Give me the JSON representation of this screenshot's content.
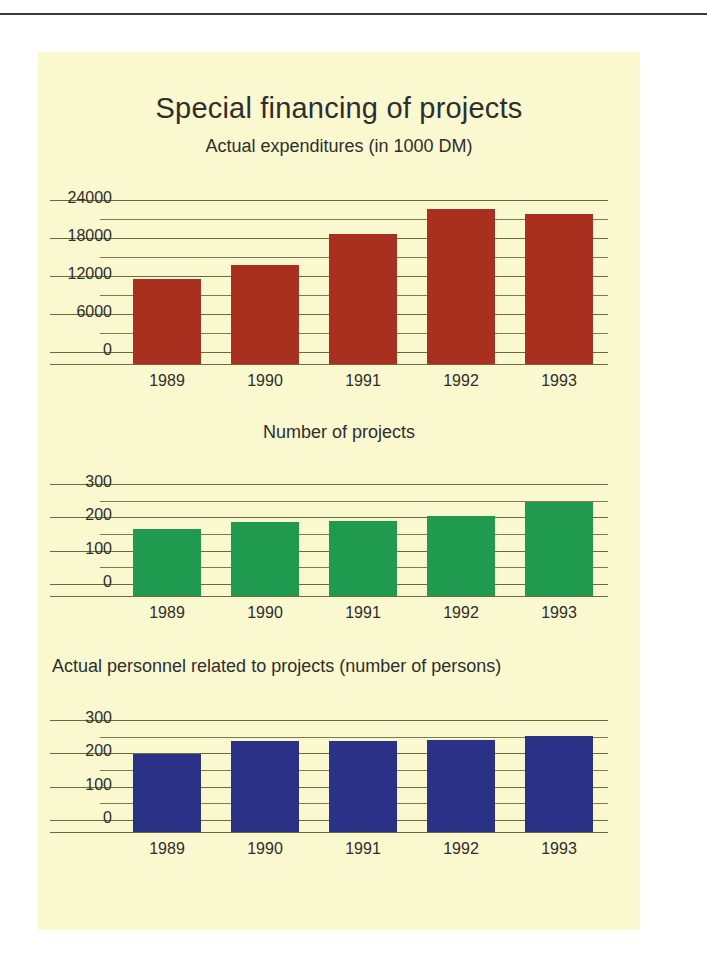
{
  "page": {
    "background_color": "#faf8ce",
    "page_color": "#ffffff",
    "rule_color": "#3b3b3b"
  },
  "header": {
    "title": "Special financing of projects"
  },
  "chart_data": [
    {
      "id": "expenditures",
      "type": "bar",
      "title": "Actual expenditures (in 1000 DM)",
      "categories": [
        "1989",
        "1990",
        "1991",
        "1992",
        "1993"
      ],
      "values": [
        11500,
        13800,
        18700,
        22600,
        21800
      ],
      "color": "#a9301e",
      "xlabel": "",
      "ylabel": "",
      "ylim": [
        0,
        24000
      ],
      "yticks": [
        "24000",
        "18000",
        "12000",
        "6000",
        "0"
      ],
      "ytick_values": [
        24000,
        18000,
        12000,
        6000,
        0
      ],
      "minor_step": 3000,
      "grid": true,
      "legend": "none"
    },
    {
      "id": "projects",
      "type": "bar",
      "title": "Number of projects",
      "categories": [
        "1989",
        "1990",
        "1991",
        "1992",
        "1993"
      ],
      "values": [
        165,
        187,
        190,
        205,
        245
      ],
      "color": "#1f9a4f",
      "xlabel": "",
      "ylabel": "",
      "ylim": [
        0,
        300
      ],
      "yticks": [
        "300",
        "200",
        "100",
        "0"
      ],
      "ytick_values": [
        300,
        200,
        100,
        0
      ],
      "minor_step": 50,
      "grid": true,
      "legend": "none"
    },
    {
      "id": "personnel",
      "type": "bar",
      "title": "Actual personnel related to projects (number of persons)",
      "categories": [
        "1989",
        "1990",
        "1991",
        "1992",
        "1993"
      ],
      "values": [
        198,
        237,
        237,
        240,
        253
      ],
      "color": "#2b3187",
      "xlabel": "",
      "ylabel": "",
      "ylim": [
        0,
        300
      ],
      "yticks": [
        "300",
        "200",
        "100",
        "0"
      ],
      "ytick_values": [
        300,
        200,
        100,
        0
      ],
      "minor_step": 50,
      "grid": true,
      "legend": "none"
    }
  ]
}
